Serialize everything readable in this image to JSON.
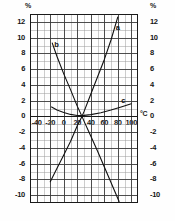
{
  "chart_data": {
    "type": "line",
    "title": "",
    "xlabel": "°C",
    "ylabel": "%",
    "y2label": "%",
    "xlim": [
      -50,
      110
    ],
    "ylim": [
      -11,
      13
    ],
    "grid": true,
    "grid_major_x_step": 20,
    "grid_minor_x_step": 10,
    "grid_major_y_step": 2,
    "grid_minor_y_step": 1,
    "legend_position": "inline-curve-labels",
    "xticks": [
      "-40",
      "-20",
      "0",
      "20",
      "40",
      "60",
      "80",
      "100"
    ],
    "xtick_values": [
      -40,
      -20,
      0,
      20,
      40,
      60,
      80,
      100
    ],
    "yticks": [
      "12",
      "10",
      "8",
      "6",
      "4",
      "2",
      "0",
      "-2",
      "-4",
      "-6",
      "-8",
      "-10"
    ],
    "ytick_values": [
      12,
      10,
      8,
      6,
      4,
      2,
      0,
      -2,
      -4,
      -6,
      -8,
      -10
    ],
    "yticks_right": [
      "12",
      "10",
      "8",
      "6",
      "4",
      "2",
      "0",
      "-2",
      "-4",
      "-6",
      "-8",
      "-10"
    ],
    "series": [
      {
        "name": "a",
        "label": "a",
        "label_x": 80,
        "label_y": 11.2,
        "points": [
          [
            -20,
            -8.3
          ],
          [
            -10,
            -6.6
          ],
          [
            0,
            -4.9
          ],
          [
            10,
            -3.2
          ],
          [
            20,
            -1.2
          ],
          [
            27,
            0.0
          ],
          [
            30,
            0.6
          ],
          [
            40,
            2.8
          ],
          [
            50,
            5.0
          ],
          [
            60,
            7.2
          ],
          [
            70,
            9.7
          ],
          [
            80,
            12.6
          ]
        ]
      },
      {
        "name": "b",
        "label": "b",
        "label_x": -11,
        "label_y": 9.1,
        "points": [
          [
            -17,
            9.3
          ],
          [
            -10,
            7.6
          ],
          [
            0,
            5.4
          ],
          [
            10,
            3.4
          ],
          [
            20,
            1.3
          ],
          [
            27,
            0.0
          ],
          [
            30,
            -0.6
          ],
          [
            40,
            -2.5
          ],
          [
            50,
            -4.4
          ],
          [
            60,
            -6.4
          ],
          [
            70,
            -8.4
          ],
          [
            82,
            -10.8
          ]
        ]
      },
      {
        "name": "c",
        "label": "c",
        "label_x": 88,
        "label_y": 2.0,
        "points": [
          [
            -18,
            1.2
          ],
          [
            -10,
            0.8
          ],
          [
            0,
            0.5
          ],
          [
            10,
            0.25
          ],
          [
            20,
            0.12
          ],
          [
            27,
            0.1
          ],
          [
            40,
            0.22
          ],
          [
            55,
            0.45
          ],
          [
            70,
            0.8
          ],
          [
            85,
            1.2
          ],
          [
            100,
            1.6
          ]
        ]
      }
    ]
  },
  "colors": {
    "curve": "#111111",
    "grid_minor": "#9a9a9a",
    "grid_major": "#3a3a3a",
    "axis": "#1a1a1a",
    "background": "#ffffff"
  }
}
